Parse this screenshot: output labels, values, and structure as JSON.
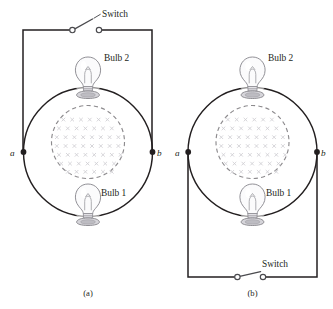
{
  "figure": {
    "panels": [
      {
        "id": "a",
        "caption": "(a)",
        "switch_label": "Switch",
        "switch_state": "open",
        "switch_position": "top",
        "bulb_top_label": "Bulb 2",
        "bulb_bottom_label": "Bulb 1",
        "node_left_label": "a",
        "node_right_label": "b",
        "field_direction": "into-page",
        "field_symbol": "x"
      },
      {
        "id": "b",
        "caption": "(b)",
        "switch_label": "Switch",
        "switch_state": "open",
        "switch_position": "bottom",
        "bulb_top_label": "Bulb 2",
        "bulb_bottom_label": "Bulb 1",
        "node_left_label": "a",
        "node_right_label": "b",
        "field_direction": "into-page",
        "field_symbol": "x"
      }
    ],
    "colors": {
      "wire": "#231f20",
      "loop": "#231f20",
      "field_boundary": "#8d8b8e",
      "field_marks": "#cfcdd2",
      "switch": "#4a4a4e",
      "background": "#ffffff"
    },
    "field_grid": {
      "rows": 7,
      "cols": 7,
      "mark": "x"
    }
  }
}
